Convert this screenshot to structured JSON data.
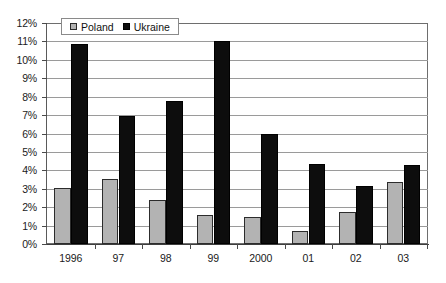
{
  "chart_data": {
    "type": "bar",
    "title": "",
    "subtitle": "",
    "xlabel": "",
    "ylabel": "",
    "categories": [
      "1996",
      "97",
      "98",
      "99",
      "2000",
      "01",
      "02",
      "03"
    ],
    "series": [
      {
        "name": "Poland",
        "color": "#b3b3b3",
        "values": [
          3.05,
          3.55,
          2.4,
          1.6,
          1.5,
          0.7,
          1.75,
          3.4
        ]
      },
      {
        "name": "Ukraine",
        "color": "#0d0d0d",
        "values": [
          10.95,
          7.0,
          7.85,
          11.15,
          6.05,
          4.4,
          3.2,
          4.35
        ]
      }
    ],
    "ylim": [
      0,
      12
    ],
    "ytick_values": [
      0,
      1,
      2,
      3,
      4,
      5,
      6,
      7,
      8,
      9,
      10,
      11,
      12
    ],
    "ytick_labels": [
      "0%",
      "1%",
      "2%",
      "3%",
      "4%",
      "5%",
      "6%",
      "7%",
      "8%",
      "9%",
      "10%",
      "11%",
      "12%"
    ],
    "grid": true,
    "grid_axis": "y",
    "legend": {
      "position": "top-inside-left",
      "entries": [
        "Poland",
        "Ukraine"
      ]
    },
    "plot_background": "#ffffff",
    "frame_color": "#6e6e6e"
  }
}
